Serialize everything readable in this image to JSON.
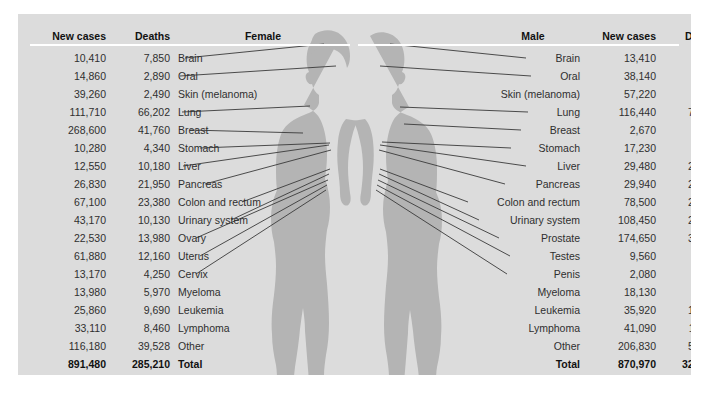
{
  "panel": {
    "background_color": "#dcdcdc",
    "silhouette_color": "#b4b4b4",
    "leader_line_color": "#3a3a3a"
  },
  "headers": {
    "left_new_cases": "New cases",
    "left_deaths": "Deaths",
    "female": "Female",
    "male": "Male",
    "right_new_cases": "New cases",
    "right_deaths": "Deaths"
  },
  "chart_data": {
    "type": "table",
    "categories": [
      "Brain",
      "Oral",
      "Skin (melanoma)",
      "Lung",
      "Breast",
      "Stomach",
      "Liver",
      "Pancreas",
      "Colon and rectum",
      "Urinary system",
      "Ovary",
      "Uterus",
      "Cervix",
      "Myeloma",
      "Leukemia",
      "Lymphoma",
      "Other"
    ],
    "male_categories": [
      "Brain",
      "Oral",
      "Skin (melanoma)",
      "Lung",
      "Breast",
      "Stomach",
      "Liver",
      "Pancreas",
      "Colon and rectum",
      "Urinary system",
      "Prostate",
      "Testes",
      "Penis",
      "Myeloma",
      "Leukemia",
      "Lymphoma",
      "Other"
    ],
    "series": [
      {
        "name": "Female new cases",
        "values": [
          10410,
          14860,
          39260,
          111710,
          268600,
          10280,
          12550,
          26830,
          67100,
          43170,
          22530,
          61880,
          13170,
          13980,
          25860,
          33110,
          116180
        ]
      },
      {
        "name": "Female deaths",
        "values": [
          7850,
          2890,
          2490,
          66202,
          41760,
          4340,
          10180,
          21950,
          23380,
          10130,
          13980,
          12160,
          4250,
          5970,
          9690,
          8460,
          39528
        ]
      },
      {
        "name": "Male new cases",
        "values": [
          13410,
          38140,
          57220,
          116440,
          2670,
          17230,
          29480,
          29940,
          78500,
          108450,
          174650,
          9560,
          2080,
          18130,
          35920,
          41090,
          206830
        ]
      },
      {
        "name": "Male deaths",
        "values": [
          9910,
          7970,
          4740,
          76650,
          500,
          6800,
          21600,
          23800,
          27640,
          23290,
          31620,
          410,
          410,
          6990,
          13150,
          11510,
          54680
        ]
      }
    ],
    "totals": {
      "female_new_cases": 891480,
      "female_deaths": 285210,
      "male_new_cases": 870970,
      "male_deaths": 321670
    }
  },
  "female_rows": [
    {
      "new_cases": "10,410",
      "deaths": "7,850",
      "label": "Brain"
    },
    {
      "new_cases": "14,860",
      "deaths": "2,890",
      "label": "Oral"
    },
    {
      "new_cases": "39,260",
      "deaths": "2,490",
      "label": "Skin (melanoma)"
    },
    {
      "new_cases": "111,710",
      "deaths": "66,202",
      "label": "Lung"
    },
    {
      "new_cases": "268,600",
      "deaths": "41,760",
      "label": "Breast"
    },
    {
      "new_cases": "10,280",
      "deaths": "4,340",
      "label": "Stomach"
    },
    {
      "new_cases": "12,550",
      "deaths": "10,180",
      "label": "Liver"
    },
    {
      "new_cases": "26,830",
      "deaths": "21,950",
      "label": "Pancreas"
    },
    {
      "new_cases": "67,100",
      "deaths": "23,380",
      "label": "Colon and rectum"
    },
    {
      "new_cases": "43,170",
      "deaths": "10,130",
      "label": "Urinary system"
    },
    {
      "new_cases": "22,530",
      "deaths": "13,980",
      "label": "Ovary"
    },
    {
      "new_cases": "61,880",
      "deaths": "12,160",
      "label": "Uterus"
    },
    {
      "new_cases": "13,170",
      "deaths": "4,250",
      "label": "Cervix"
    },
    {
      "new_cases": "13,980",
      "deaths": "5,970",
      "label": "Myeloma"
    },
    {
      "new_cases": "25,860",
      "deaths": "9,690",
      "label": "Leukemia"
    },
    {
      "new_cases": "33,110",
      "deaths": "8,460",
      "label": "Lymphoma"
    },
    {
      "new_cases": "116,180",
      "deaths": "39,528",
      "label": "Other"
    }
  ],
  "female_total": {
    "new_cases": "891,480",
    "deaths": "285,210",
    "label": "Total"
  },
  "male_rows": [
    {
      "label": "Brain",
      "new_cases": "13,410",
      "deaths": "9,910"
    },
    {
      "label": "Oral",
      "new_cases": "38,140",
      "deaths": "7,970"
    },
    {
      "label": "Skin (melanoma)",
      "new_cases": "57,220",
      "deaths": "4,740"
    },
    {
      "label": "Lung",
      "new_cases": "116,440",
      "deaths": "76,650"
    },
    {
      "label": "Breast",
      "new_cases": "2,670",
      "deaths": "500"
    },
    {
      "label": "Stomach",
      "new_cases": "17,230",
      "deaths": "6,800"
    },
    {
      "label": "Liver",
      "new_cases": "29,480",
      "deaths": "21,600"
    },
    {
      "label": "Pancreas",
      "new_cases": "29,940",
      "deaths": "23,800"
    },
    {
      "label": "Colon and rectum",
      "new_cases": "78,500",
      "deaths": "27,640"
    },
    {
      "label": "Urinary system",
      "new_cases": "108,450",
      "deaths": "23,290"
    },
    {
      "label": "Prostate",
      "new_cases": "174,650",
      "deaths": "31,620"
    },
    {
      "label": "Testes",
      "new_cases": "9,560",
      "deaths": "410"
    },
    {
      "label": "Penis",
      "new_cases": "2,080",
      "deaths": "410"
    },
    {
      "label": "Myeloma",
      "new_cases": "18,130",
      "deaths": "6,990"
    },
    {
      "label": "Leukemia",
      "new_cases": "35,920",
      "deaths": "13,150"
    },
    {
      "label": "Lymphoma",
      "new_cases": "41,090",
      "deaths": "11,510"
    },
    {
      "label": "Other",
      "new_cases": "206,830",
      "deaths": "54,680"
    }
  ],
  "male_total": {
    "label": "Total",
    "new_cases": "870,970",
    "deaths": "321,670"
  }
}
